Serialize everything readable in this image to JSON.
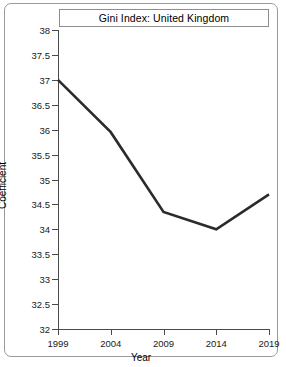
{
  "chart_data": {
    "type": "line",
    "title": "Gini Index: United Kingdom",
    "xlabel": "Year",
    "ylabel": "Coefficient",
    "x": [
      1999,
      2004,
      2009,
      2014,
      2019
    ],
    "values": [
      37.0,
      35.95,
      34.35,
      34.0,
      34.7
    ],
    "xticklabels": [
      "1999",
      "2004",
      "2009",
      "2014",
      "2019"
    ],
    "yticklabels": [
      "32",
      "32.5",
      "33",
      "33.5",
      "34",
      "34.5",
      "35",
      "35.5",
      "36",
      "36.5",
      "37",
      "37.5",
      "38"
    ],
    "yticks": [
      32,
      32.5,
      33,
      33.5,
      34,
      34.5,
      35,
      35.5,
      36,
      36.5,
      37,
      37.5,
      38
    ],
    "xlim": [
      1999,
      2019
    ],
    "ylim": [
      32,
      38
    ],
    "grid": false,
    "legend": false,
    "line_color": "#2b2b2b",
    "line_width": 2.6
  }
}
